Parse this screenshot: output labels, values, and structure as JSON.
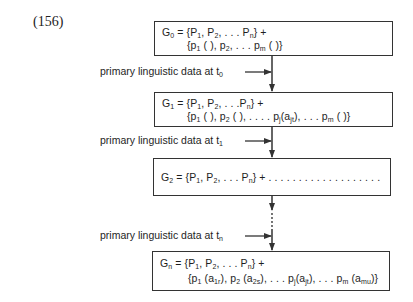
{
  "example_number": "(156)",
  "boxes": [
    {
      "id": "G0",
      "lines": [
        {
          "head": "G",
          "head_sub": "0",
          "parts": [
            " = {P",
            "1",
            ", P",
            "2",
            ", . . . P",
            "n",
            "} +"
          ]
        },
        {
          "parts": [
            "{p",
            "1",
            " ( ), p",
            "2",
            ", . . . p",
            "m",
            " ( )}"
          ]
        }
      ]
    },
    {
      "id": "G1",
      "lines": [
        {
          "head": "G",
          "head_sub": "1",
          "parts": [
            " = {P",
            "1",
            ", P",
            "2",
            ", . . .P",
            "n",
            "} +"
          ]
        },
        {
          "parts": [
            "{p",
            "1",
            " ( ), p",
            "2",
            " ( ), . . . . p",
            "j",
            "(a",
            "jt",
            "), . . . p",
            "m",
            " ( )}"
          ]
        }
      ]
    },
    {
      "id": "G2",
      "lines": [
        {
          "head": "G",
          "head_sub": "2",
          "parts": [
            " = {P",
            "1",
            ", P",
            "2",
            ", . . . P",
            "n",
            "} + . . . . . . . . . . . . . . . . . . ."
          ]
        }
      ]
    },
    {
      "id": "Gn",
      "lines": [
        {
          "head": "G",
          "head_sub": "n",
          "parts": [
            " = {P",
            "1",
            ", P",
            "2",
            ", . . . P",
            "n",
            "} +"
          ]
        },
        {
          "parts": [
            "{p",
            "1",
            " (a",
            "1r",
            "), p",
            "2",
            " (a",
            "2s",
            "), . . . p",
            "j",
            "(a",
            "jt",
            "), . . . p",
            "m",
            " (a",
            "mu",
            ")}"
          ]
        }
      ]
    }
  ],
  "inputs": [
    {
      "text": "primary linguistic data at t",
      "sub": "0"
    },
    {
      "text": "primary linguistic data at t",
      "sub": "1"
    },
    {
      "text": "primary linguistic data at t",
      "sub": "n"
    }
  ],
  "colors": {
    "line": "#333333",
    "text": "#1e1e1e",
    "background": "#ffffff"
  }
}
